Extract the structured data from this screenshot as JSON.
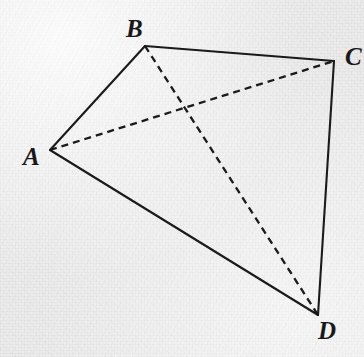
{
  "figure": {
    "kind": "geometry-diagram",
    "width": 364,
    "height": 357,
    "background_color": "#ececec",
    "ink_color": "#1a1a1c"
  },
  "chart_data": {
    "type": "diagram",
    "title": "",
    "xlabel": "",
    "ylabel": "",
    "coordinate_space": {
      "x_range": [
        0,
        364
      ],
      "y_range": [
        0,
        357
      ],
      "y_axis": "down"
    },
    "grid": false,
    "legend": null,
    "points": [
      {
        "id": "A",
        "label": "A",
        "x": 50,
        "y": 150
      },
      {
        "id": "B",
        "label": "B",
        "x": 145,
        "y": 46
      },
      {
        "id": "C",
        "label": "C",
        "x": 334,
        "y": 61
      },
      {
        "id": "D",
        "label": "D",
        "x": 318,
        "y": 315
      }
    ],
    "label_offsets": [
      {
        "id": "A",
        "label": "A",
        "left": 23,
        "top": 144,
        "anchor": "left-of-vertex"
      },
      {
        "id": "B",
        "label": "B",
        "left": 126,
        "top": 16,
        "anchor": "above-left-of-vertex"
      },
      {
        "id": "C",
        "label": "C",
        "left": 345,
        "top": 44,
        "anchor": "right-of-vertex-clipped"
      },
      {
        "id": "D",
        "label": "D",
        "left": 318,
        "top": 318,
        "anchor": "below-right-of-vertex"
      }
    ],
    "segments": [
      {
        "id": "AB",
        "from": "A",
        "to": "B",
        "style": "solid",
        "x1": 50,
        "y1": 150,
        "x2": 145,
        "y2": 46
      },
      {
        "id": "BC",
        "from": "B",
        "to": "C",
        "style": "solid",
        "x1": 145,
        "y1": 46,
        "x2": 334,
        "y2": 61
      },
      {
        "id": "CD",
        "from": "C",
        "to": "D",
        "style": "solid",
        "x1": 334,
        "y1": 61,
        "x2": 318,
        "y2": 315
      },
      {
        "id": "DA",
        "from": "D",
        "to": "A",
        "style": "solid",
        "x1": 318,
        "y1": 315,
        "x2": 50,
        "y2": 150
      },
      {
        "id": "AC",
        "from": "A",
        "to": "C",
        "style": "dashed",
        "x1": 50,
        "y1": 150,
        "x2": 334,
        "y2": 61
      },
      {
        "id": "BD",
        "from": "B",
        "to": "D",
        "style": "dashed",
        "x1": 145,
        "y1": 46,
        "x2": 318,
        "y2": 315
      }
    ],
    "intersections": [
      {
        "id": "AC-BD",
        "of": [
          "AC",
          "BD"
        ],
        "x": 186,
        "y": 110,
        "marked": false
      }
    ],
    "stroke": {
      "solid_width": 2.1,
      "dashed_width": 2.3,
      "dash_length": 7,
      "dash_gap": 5
    }
  }
}
